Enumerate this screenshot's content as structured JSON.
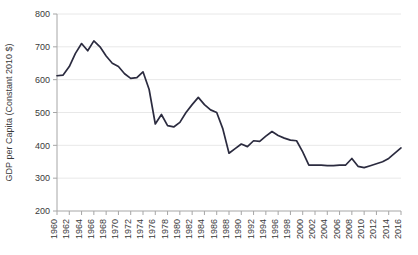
{
  "chart_data": {
    "type": "line",
    "title": "",
    "subtitle": "",
    "xlabel": "",
    "ylabel": "GDP per Capita (Constant 2010 $)",
    "ylim": [
      200,
      800
    ],
    "xlim": [
      1960,
      2016
    ],
    "ytick_step": 100,
    "yticks": [
      200,
      300,
      400,
      500,
      600,
      700,
      800
    ],
    "ytick_labels": [
      "200",
      "300",
      "400",
      "500",
      "600",
      "700",
      "800"
    ],
    "xtick_step": 2,
    "xticks": [
      1960,
      1962,
      1964,
      1966,
      1968,
      1970,
      1972,
      1974,
      1976,
      1978,
      1980,
      1982,
      1984,
      1986,
      1988,
      1990,
      1992,
      1994,
      1996,
      1998,
      2000,
      2002,
      2004,
      2006,
      2008,
      2010,
      2012,
      2014,
      2016
    ],
    "xtick_labels": [
      "1960",
      "1962",
      "1964",
      "1966",
      "1968",
      "1970",
      "1972",
      "1974",
      "1976",
      "1978",
      "1980",
      "1982",
      "1984",
      "1986",
      "1988",
      "1990",
      "1992",
      "1994",
      "1996",
      "1998",
      "2000",
      "2002",
      "2004",
      "2006",
      "2008",
      "2010",
      "2012",
      "2014",
      "2016"
    ],
    "xtick_label_rotation": -90,
    "grid": true,
    "grid_axis": "y",
    "legend": false,
    "legend_position": "none",
    "line_color": "#2b2b3f",
    "grid_color": "#e8e8e8",
    "axis_color": "#a6a6a6",
    "series": [
      {
        "name": "GDP per Capita (Constant 2010 $)",
        "x": [
          1960,
          1961,
          1962,
          1963,
          1964,
          1965,
          1966,
          1967,
          1968,
          1969,
          1970,
          1971,
          1972,
          1973,
          1974,
          1975,
          1976,
          1977,
          1978,
          1979,
          1980,
          1981,
          1982,
          1983,
          1984,
          1985,
          1986,
          1987,
          1988,
          1989,
          1990,
          1991,
          1992,
          1993,
          1994,
          1995,
          1996,
          1997,
          1998,
          1999,
          2000,
          2001,
          2002,
          2003,
          2004,
          2005,
          2006,
          2007,
          2008,
          2009,
          2010,
          2011,
          2012,
          2013,
          2014,
          2015,
          2016
        ],
        "values": [
          612,
          614,
          640,
          680,
          710,
          688,
          718,
          700,
          672,
          650,
          640,
          618,
          604,
          606,
          624,
          570,
          465,
          494,
          460,
          456,
          470,
          500,
          524,
          546,
          524,
          508,
          500,
          450,
          376,
          390,
          404,
          396,
          414,
          412,
          428,
          442,
          430,
          422,
          416,
          414,
          380,
          340,
          340,
          340,
          338,
          338,
          340,
          340,
          360,
          336,
          332,
          338,
          344,
          350,
          360,
          376,
          392
        ]
      }
    ]
  }
}
